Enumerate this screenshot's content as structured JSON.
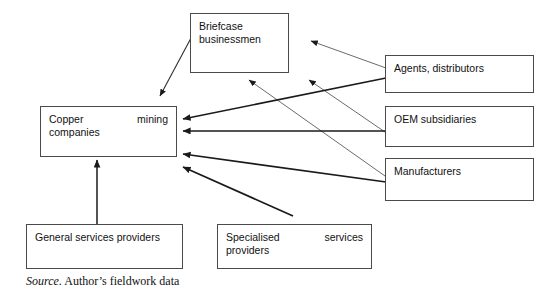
{
  "diagram": {
    "nodes": [
      {
        "id": "briefcase_businessmen",
        "label": "Briefcase businessmen",
        "line1": "Briefcase",
        "line2": "businessmen"
      },
      {
        "id": "copper_mining_companies",
        "label": "Copper mining companies",
        "line1_left": "Copper",
        "line1_right": "mining",
        "line2": "companies"
      },
      {
        "id": "agents_distributors",
        "label": "Agents, distributors",
        "line1": "Agents, distributors"
      },
      {
        "id": "oem_subsidiaries",
        "label": "OEM subsidiaries",
        "line1": "OEM subsidiaries"
      },
      {
        "id": "manufacturers",
        "label": "Manufacturers",
        "line1": "Manufacturers"
      },
      {
        "id": "general_services_providers",
        "label": "General services providers",
        "line1": "General services providers"
      },
      {
        "id": "specialised_services_providers",
        "label": "Specialised services providers",
        "line1_left": "Specialised",
        "line1_right": "services",
        "line2": "providers"
      }
    ],
    "edges": [
      {
        "id": "briefcase-to-copper",
        "from": "briefcase_businessmen",
        "to": "copper_mining_companies",
        "weight": "thin"
      },
      {
        "id": "agents-to-briefcase",
        "from": "agents_distributors",
        "to": "briefcase_businessmen",
        "weight": "thin"
      },
      {
        "id": "manufacturers-to-briefcase",
        "from": "manufacturers",
        "to": "briefcase_businessmen",
        "weight": "thin"
      },
      {
        "id": "oem-to-briefcase",
        "from": "oem_subsidiaries",
        "to": "briefcase_businessmen",
        "weight": "thin"
      },
      {
        "id": "agents-to-copper",
        "from": "agents_distributors",
        "to": "copper_mining_companies",
        "weight": "thick"
      },
      {
        "id": "oem-to-copper",
        "from": "oem_subsidiaries",
        "to": "copper_mining_companies",
        "weight": "thick"
      },
      {
        "id": "manufacturers-to-copper",
        "from": "manufacturers",
        "to": "copper_mining_companies",
        "weight": "thick"
      },
      {
        "id": "specialised-to-copper",
        "from": "specialised_services_providers",
        "to": "copper_mining_companies",
        "weight": "thick"
      },
      {
        "id": "general-to-copper",
        "from": "general_services_providers",
        "to": "copper_mining_companies",
        "weight": "thick"
      }
    ],
    "caption": {
      "source_label": "Source.",
      "source_text": "Author’s fieldwork data"
    },
    "colors": {
      "box_border": "#4a4a4a",
      "text": "#111111",
      "edge": "#1a1a1a",
      "edge_light": "#6b6b6b",
      "background": "#ffffff"
    }
  }
}
